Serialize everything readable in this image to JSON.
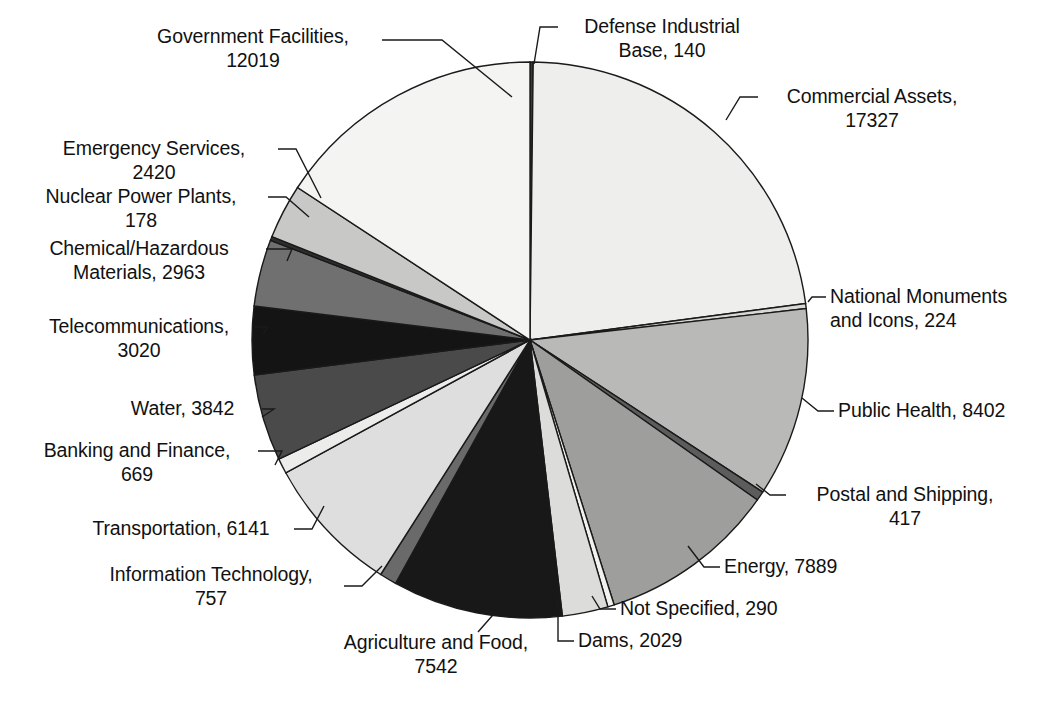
{
  "chart_data": {
    "type": "pie",
    "title": "",
    "subtitle": "",
    "xlabel": "",
    "ylabel": "",
    "legend_position": "callout-labels",
    "grid": false,
    "total": 76269,
    "start_angle_deg": 0,
    "direction": "clockwise",
    "categories": [
      "Defense Industrial Base",
      "Commercial Assets",
      "National Monuments and Icons",
      "Public Health",
      "Postal and Shipping",
      "Energy",
      "Not Specified",
      "Dams",
      "Agriculture and Food",
      "Information Technology",
      "Transportation",
      "Banking and Finance",
      "Water",
      "Telecommunications",
      "Chemical/Hazardous Materials",
      "Nuclear Power Plants",
      "Emergency Services",
      "Government Facilities"
    ],
    "values": [
      140,
      17327,
      224,
      8402,
      417,
      7889,
      290,
      2029,
      7542,
      757,
      6141,
      669,
      3842,
      3020,
      2963,
      178,
      2420,
      12019
    ],
    "colors": [
      "#3a3a3a",
      "#eeeeec",
      "#d8d8d6",
      "#b9b9b7",
      "#5c5c5c",
      "#9e9e9c",
      "#f2f2f0",
      "#dcdcda",
      "#181818",
      "#6a6a6a",
      "#dedede",
      "#ececea",
      "#4a4a4a",
      "#141414",
      "#707070",
      "#2e2e2e",
      "#c8c8c6",
      "#f4f4f2"
    ]
  },
  "geometry": {
    "center_x": 530,
    "center_y": 340,
    "radius": 278
  },
  "labels": [
    {
      "name": "government-facilities",
      "lines": [
        "Government Facilities,",
        "12019"
      ],
      "x": 128,
      "y": 24,
      "width": 250,
      "align": "center",
      "leader": "M 382 40 L 442 40 L 512 97"
    },
    {
      "name": "defense-industrial-base",
      "lines": [
        "Defense Industrial",
        "Base, 140"
      ],
      "x": 562,
      "y": 14,
      "width": 200,
      "align": "center",
      "leader": "M 558 27 L 540 27 L 534 64"
    },
    {
      "name": "commercial-assets",
      "lines": [
        "Commercial Assets,",
        "17327"
      ],
      "x": 762,
      "y": 84,
      "width": 220,
      "align": "center",
      "leader": "M 758 97 L 740 97 L 726 120"
    },
    {
      "name": "emergency-services",
      "lines": [
        "Emergency Services,",
        "2420"
      ],
      "x": 34,
      "y": 136,
      "width": 240,
      "align": "center",
      "leader": "M 278 149 L 296 149 L 321 198"
    },
    {
      "name": "nuclear-power-plants",
      "lines": [
        "Nuclear Power Plants,",
        "178"
      ],
      "x": 16,
      "y": 184,
      "width": 250,
      "align": "center",
      "leader": "M 268 197 L 286 197 L 309 217"
    },
    {
      "name": "chemical-hazardous-materials",
      "lines": [
        "Chemical/Hazardous",
        "Materials, 2963"
      ],
      "x": 14,
      "y": 236,
      "width": 250,
      "align": "center",
      "leader": "M 266 249 L 292 249 L 287 261"
    },
    {
      "name": "telecommunications",
      "lines": [
        "Telecommunications,",
        "3020"
      ],
      "x": 24,
      "y": 314,
      "width": 230,
      "align": "center",
      "leader": "M 254 327 L 268 327 L 263 334"
    },
    {
      "name": "water",
      "lines": [
        "Water, 3842"
      ],
      "x": 110,
      "y": 396,
      "width": 145,
      "align": "center",
      "leader": "M 262 409 L 274 409 L 262 417"
    },
    {
      "name": "banking-and-finance",
      "lines": [
        "Banking and Finance,",
        "669"
      ],
      "x": 18,
      "y": 438,
      "width": 238,
      "align": "center",
      "leader": "M 258 451 L 282 451 L 275 465"
    },
    {
      "name": "transportation",
      "lines": [
        "Transportation, 6141"
      ],
      "x": 72,
      "y": 516,
      "width": 218,
      "align": "center",
      "leader": "M 294 529 L 312 529 L 324 506"
    },
    {
      "name": "information-technology",
      "lines": [
        "Information Technology,",
        "757"
      ],
      "x": 80,
      "y": 562,
      "width": 262,
      "align": "center",
      "leader": "M 344 586 L 362 586 L 382 566"
    },
    {
      "name": "agriculture-and-food",
      "lines": [
        "Agriculture and Food,",
        "7542"
      ],
      "x": 316,
      "y": 630,
      "width": 240,
      "align": "center",
      "leader": "M 478 632 L 492 616 L 516 590"
    },
    {
      "name": "dams",
      "lines": [
        "Dams, 2029"
      ],
      "x": 578,
      "y": 628,
      "width": 140,
      "align": "left",
      "leader": "M 574 641 L 558 641 L 558 596"
    },
    {
      "name": "not-specified",
      "lines": [
        "Not Specified, 290"
      ],
      "x": 620,
      "y": 596,
      "width": 200,
      "align": "left",
      "leader": "M 616 609 L 600 609 L 592 596"
    },
    {
      "name": "energy",
      "lines": [
        "Energy, 7889"
      ],
      "x": 724,
      "y": 554,
      "width": 160,
      "align": "left",
      "leader": "M 720 567 L 704 567 L 688 546"
    },
    {
      "name": "postal-and-shipping",
      "lines": [
        "Postal and Shipping,",
        "417"
      ],
      "x": 790,
      "y": 482,
      "width": 230,
      "align": "center",
      "leader": "M 786 495 L 770 495 L 756 484"
    },
    {
      "name": "public-health",
      "lines": [
        "Public Health, 8402"
      ],
      "x": 838,
      "y": 398,
      "width": 210,
      "align": "left",
      "leader": "M 834 411 L 818 411 L 802 398"
    },
    {
      "name": "national-monuments-and-icons",
      "lines": [
        "National Monuments",
        "and Icons, 224"
      ],
      "x": 830,
      "y": 284,
      "width": 220,
      "align": "left",
      "leader": "M 826 297 L 812 297 L 808 302"
    }
  ]
}
